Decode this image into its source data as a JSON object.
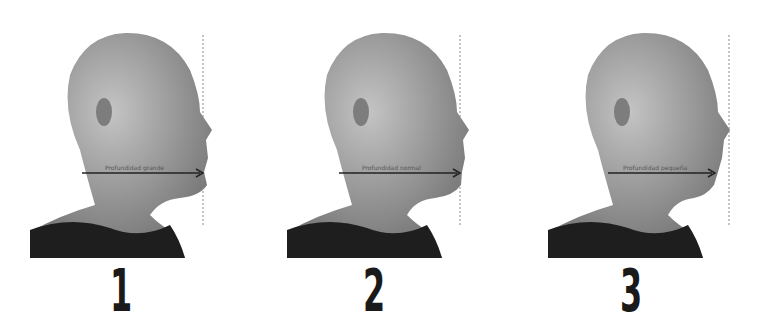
{
  "figures": [
    {
      "id": 1,
      "number_label": "1",
      "arrow_label": "Profundidad grande"
    },
    {
      "id": 2,
      "number_label": "2",
      "arrow_label": "Profundidad normal"
    },
    {
      "id": 3,
      "number_label": "3",
      "arrow_label": "Profundidad pequeña"
    }
  ],
  "colors": {
    "background": "#ffffff",
    "skin": "#9a9a9a",
    "shirt": "#1e1e1e",
    "arrow": "#222222",
    "dashed_line": "#888888"
  }
}
